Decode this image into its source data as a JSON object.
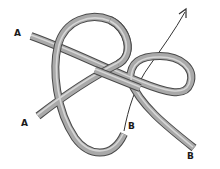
{
  "diagram": {
    "type": "knot-tying illustration",
    "labels": [
      {
        "id": "end-a-top",
        "text": "A",
        "x": 14,
        "y": 29
      },
      {
        "id": "end-a-bottom",
        "text": "A",
        "x": 21,
        "y": 119
      },
      {
        "id": "end-b-middle",
        "text": "B",
        "x": 128,
        "y": 122
      },
      {
        "id": "end-b-bottom",
        "text": "B",
        "x": 187,
        "y": 152
      }
    ],
    "arrow": {
      "direction": "up-right",
      "meaning": "pull direction of working end"
    },
    "colors": {
      "background": "#ffffff",
      "rope_fill": "#a9a9a9",
      "rope_outline": "#4a4a4a",
      "rope_highlight": "#d6d6d6",
      "arrow": "#333333",
      "label": "#1a1a1a"
    }
  }
}
